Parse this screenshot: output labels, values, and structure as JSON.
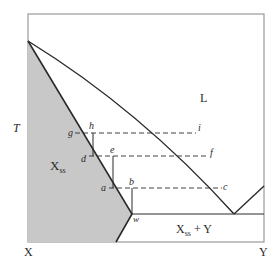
{
  "diagram": {
    "type": "binary-phase-diagram",
    "axis": {
      "y_label": "T",
      "x_left_label": "X",
      "x_right_label": "Y"
    },
    "regions": {
      "liquid": "L",
      "solid_solution": "X",
      "solid_solution_sub": "ss",
      "two_phase_left": "X",
      "two_phase_sub": "ss",
      "two_phase_rest": " + Y"
    },
    "points": {
      "g": "g",
      "h": "h",
      "i": "i",
      "d": "d",
      "e": "e",
      "f": "f",
      "a": "a",
      "b": "b",
      "c": "c",
      "w": "w"
    },
    "colors": {
      "solid_fill": "#c8c8c8",
      "line": "#2a2a2a",
      "frame": "#9a9a9a"
    }
  }
}
